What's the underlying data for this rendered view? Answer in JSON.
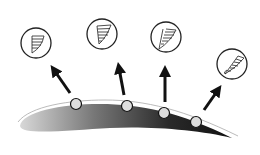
{
  "diagram": {
    "airfoil": {
      "fill_dark": "#222222",
      "fill_light": "#cccccc",
      "outline": "#999999"
    },
    "stations": [
      {
        "id": 1,
        "marker": [
          76,
          104
        ],
        "arrow_from": [
          73,
          96
        ],
        "arrow_to": [
          52,
          68
        ],
        "bubble": [
          38,
          43
        ],
        "profile": "full"
      },
      {
        "id": 2,
        "marker": [
          127,
          106
        ],
        "arrow_from": [
          125,
          97
        ],
        "arrow_to": [
          119,
          66
        ],
        "bubble": [
          105,
          34
        ],
        "profile": "thinner"
      },
      {
        "id": 3,
        "marker": [
          165,
          112
        ],
        "arrow_from": [
          165,
          102
        ],
        "arrow_to": [
          165,
          68
        ],
        "bubble": [
          167,
          38
        ],
        "profile": "inflected"
      },
      {
        "id": 4,
        "marker": [
          196,
          122
        ],
        "arrow_from": [
          205,
          110
        ],
        "arrow_to": [
          220,
          86
        ],
        "bubble": [
          232,
          63
        ],
        "profile": "separated"
      }
    ]
  }
}
